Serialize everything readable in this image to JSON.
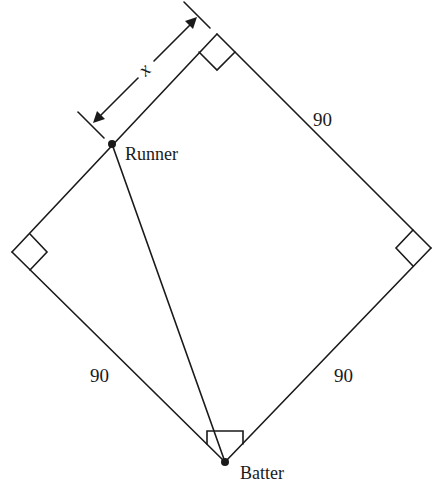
{
  "diagram": {
    "type": "baseball-diamond",
    "stroke_color": "#1a1a1a",
    "background": "#ffffff",
    "vertices": {
      "home": {
        "x": 225,
        "y": 462
      },
      "first": {
        "x": 431,
        "y": 248
      },
      "second": {
        "x": 217,
        "y": 34
      },
      "third": {
        "x": 12,
        "y": 252
      }
    },
    "runner_point": {
      "x": 112,
      "y": 144
    },
    "labels": {
      "side_upper_right": "90",
      "side_lower_left": "90",
      "side_lower_right": "90",
      "runner": "Runner",
      "batter": "Batter",
      "distance_variable": "x"
    }
  }
}
